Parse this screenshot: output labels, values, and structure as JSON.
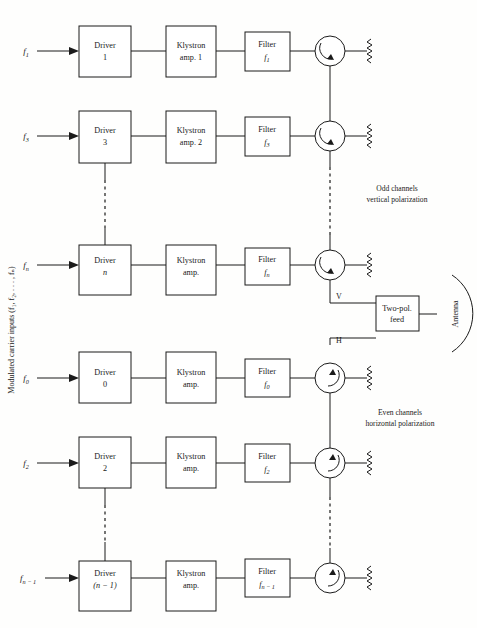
{
  "figure": {
    "type": "block-diagram",
    "side_label": "Modulated carrier inputs (f₁, f₂, . . . , fₙ)",
    "annotations": [
      {
        "id": "odd",
        "line1": "Odd channels",
        "line2": "vertical polarization"
      },
      {
        "id": "even",
        "line1": "Even channels",
        "line2": "horizontal polarization"
      }
    ],
    "port_labels": {
      "vertical": "V",
      "horizontal": "H"
    },
    "feed": {
      "line1": "Two-pol.",
      "line2": "feed"
    },
    "antenna": {
      "label": "Antenna"
    },
    "colors": {
      "ink": "#1a1a1a",
      "paper": "#fefefd"
    },
    "chains": [
      {
        "id": "ch1",
        "input": "f",
        "input_sub": "1",
        "driver_line1": "Driver",
        "driver_line2": "1",
        "amp_line1": "Klystron",
        "amp_line2": "amp. 1",
        "filter_line1": "Filter",
        "filter_f": "f",
        "filter_sub": "1",
        "group": "odd"
      },
      {
        "id": "ch3",
        "input": "f",
        "input_sub": "3",
        "driver_line1": "Driver",
        "driver_line2": "3",
        "amp_line1": "Klystron",
        "amp_line2": "amp. 2",
        "filter_line1": "Filter",
        "filter_f": "f",
        "filter_sub": "3",
        "group": "odd"
      },
      {
        "id": "chn",
        "input": "f",
        "input_sub": "n",
        "driver_line1": "Driver",
        "driver_line2": "n",
        "amp_line1": "Klystron",
        "amp_line2": "amp.",
        "filter_line1": "Filter",
        "filter_f": "f",
        "filter_sub": "n",
        "group": "odd"
      },
      {
        "id": "ch0",
        "input": "f",
        "input_sub": "0",
        "driver_line1": "Driver",
        "driver_line2": "0",
        "amp_line1": "Klystron",
        "amp_line2": "amp.",
        "filter_line1": "Filter",
        "filter_f": "f",
        "filter_sub": "0",
        "group": "even"
      },
      {
        "id": "ch2",
        "input": "f",
        "input_sub": "2",
        "driver_line1": "Driver",
        "driver_line2": "2",
        "amp_line1": "Klystron",
        "amp_line2": "amp.",
        "filter_line1": "Filter",
        "filter_f": "f",
        "filter_sub": "2",
        "group": "even"
      },
      {
        "id": "chn1",
        "input": "f",
        "input_sub": "n − 1",
        "driver_line1": "Driver",
        "driver_line2": "(n − 1)",
        "amp_line1": "Klystron",
        "amp_line2": "amp.",
        "filter_line1": "Filter",
        "filter_f": "f",
        "filter_sub": "n − 1",
        "group": "even"
      }
    ]
  }
}
